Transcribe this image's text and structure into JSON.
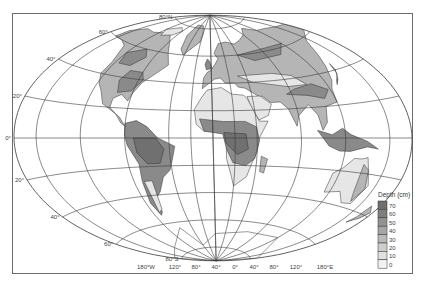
{
  "map": {
    "title": "Depth (cm)",
    "projection": "Aitoff-like world projection with graticule",
    "latitude_labels": [
      {
        "lat": 80,
        "text": "80°N"
      },
      {
        "lat": 60,
        "text": "60°"
      },
      {
        "lat": 40,
        "text": "40°"
      },
      {
        "lat": 20,
        "text": "20°"
      },
      {
        "lat": 0,
        "text": "0°"
      },
      {
        "lat": -20,
        "text": "20°"
      },
      {
        "lat": -40,
        "text": "40°"
      },
      {
        "lat": -60,
        "text": "60°"
      },
      {
        "lat": -80,
        "text": "80°S"
      }
    ],
    "longitude_labels": [
      {
        "lon": -180,
        "text": "180°W"
      },
      {
        "lon": -120,
        "text": "120°"
      },
      {
        "lon": -80,
        "text": "80°"
      },
      {
        "lon": -40,
        "text": "40°"
      },
      {
        "lon": 0,
        "text": "0°"
      },
      {
        "lon": 40,
        "text": "40°"
      },
      {
        "lon": 80,
        "text": "80°"
      },
      {
        "lon": 120,
        "text": "120°"
      },
      {
        "lon": 180,
        "text": "180°E"
      }
    ]
  },
  "legend": {
    "title": "Depth (cm)",
    "ticks": [
      "70",
      "60",
      "50",
      "40",
      "30",
      "20",
      "10",
      "0"
    ],
    "colors": [
      "#6e6e6e",
      "#7f7f7f",
      "#929292",
      "#a6a6a6",
      "#bababa",
      "#cecece",
      "#e0e0e0",
      "#f2f2f2"
    ]
  },
  "colors": {
    "graticule": "#3a3a3a",
    "frame": "#6b6b6b",
    "land_low": "#e6e6e6",
    "land_mid": "#b5b5b5",
    "land_high": "#8a8a8a",
    "land_max": "#707070"
  }
}
